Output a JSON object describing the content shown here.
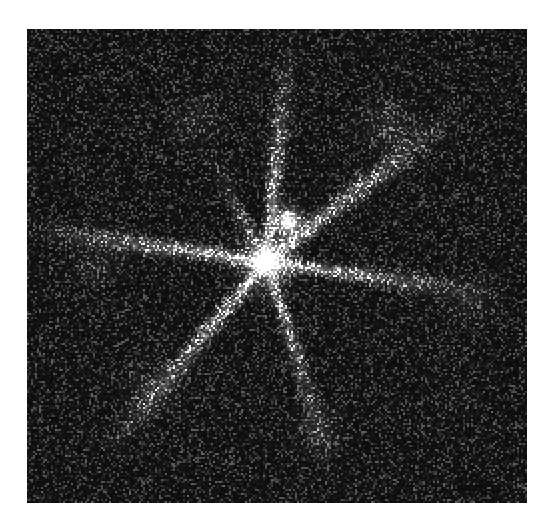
{
  "figure": {
    "domain": "natural-image",
    "kind": "astronomical-image",
    "canvas": {
      "width": 552,
      "height": 528,
      "background_color": "#ffffff"
    }
  },
  "image_panel": {
    "name": "sky-image",
    "x": 27,
    "y": 29,
    "width": 500,
    "height": 474,
    "background_color": "#000000",
    "border": "none",
    "colormap": "grayscale",
    "orientation": "north-up-east-left"
  },
  "render": {
    "pixel_scale": 2,
    "noise": {
      "type": "poisson-speckle",
      "background_level": 0.055,
      "speckle_density": 0.42,
      "speckle_gain": 0.55,
      "grain_size": 2,
      "seed": 20240517
    },
    "gamma": 0.95,
    "white_point": "#ffffff",
    "black_point": "#000000"
  },
  "sources": [
    {
      "name": "primary-core",
      "label": "bright central point source",
      "x": 265,
      "y": 261,
      "peak_brightness": 1.0,
      "core_radius": 15,
      "halo_radius": 52,
      "halo_strength": 0.42
    },
    {
      "name": "secondary-knot",
      "label": "secondary bright knot north-east of core",
      "x": 287,
      "y": 221,
      "peak_brightness": 0.9,
      "core_radius": 11,
      "halo_radius": 34,
      "halo_strength": 0.3
    }
  ],
  "diffraction_spikes": [
    {
      "name": "spike-north",
      "angle_deg": 84,
      "length": 235,
      "width": 11,
      "intensity": 0.4,
      "falloff": 1.35
    },
    {
      "name": "spike-north-east",
      "angle_deg": 38,
      "length": 255,
      "width": 13,
      "intensity": 0.43,
      "falloff": 1.25
    },
    {
      "name": "spike-east",
      "angle_deg": -8,
      "length": 240,
      "width": 11,
      "intensity": 0.4,
      "falloff": 1.3
    },
    {
      "name": "spike-south-east",
      "angle_deg": -72,
      "length": 225,
      "width": 11,
      "intensity": 0.33,
      "falloff": 1.35
    },
    {
      "name": "spike-south-west",
      "angle_deg": -130,
      "length": 255,
      "width": 12,
      "intensity": 0.42,
      "falloff": 1.2
    },
    {
      "name": "spike-west",
      "angle_deg": 172,
      "length": 250,
      "width": 12,
      "intensity": 0.42,
      "falloff": 1.25
    },
    {
      "name": "spike-north-west",
      "angle_deg": 118,
      "length": 140,
      "width": 10,
      "intensity": 0.2,
      "falloff": 1.5
    }
  ],
  "diffuse_patches": [
    {
      "name": "patch-upper-right",
      "x": 388,
      "y": 126,
      "radius": 46,
      "intensity": 0.13
    },
    {
      "name": "patch-upper-left",
      "x": 196,
      "y": 120,
      "radius": 40,
      "intensity": 0.1
    },
    {
      "name": "patch-lower-left",
      "x": 150,
      "y": 388,
      "radius": 44,
      "intensity": 0.1
    },
    {
      "name": "patch-lower-center",
      "x": 318,
      "y": 430,
      "radius": 40,
      "intensity": 0.1
    },
    {
      "name": "patch-mid-left",
      "x": 96,
      "y": 262,
      "radius": 38,
      "intensity": 0.09
    },
    {
      "name": "patch-right-edge",
      "x": 470,
      "y": 300,
      "radius": 40,
      "intensity": 0.09
    }
  ],
  "annotations": {
    "has_axes": false,
    "has_ticks": false,
    "has_colorbar": false,
    "has_scalebar": false,
    "has_compass": false,
    "has_title": false,
    "caption_text": ""
  }
}
